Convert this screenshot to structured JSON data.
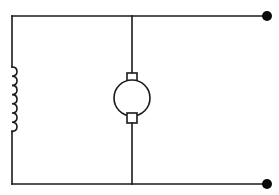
{
  "diagram": {
    "type": "circuit-schematic",
    "colors": {
      "line": "#1a1a1a",
      "terminal": "#0a0a0a",
      "background": "#ffffff"
    },
    "components": [
      {
        "id": "field-winding",
        "kind": "inductor",
        "turns": 7,
        "position": "left branch"
      },
      {
        "id": "armature",
        "kind": "dc-motor",
        "brushes": 2,
        "position": "middle branch"
      },
      {
        "id": "terminal-positive",
        "kind": "terminal",
        "position": "top right"
      },
      {
        "id": "terminal-negative",
        "kind": "terminal",
        "position": "bottom right"
      }
    ],
    "labels": []
  }
}
